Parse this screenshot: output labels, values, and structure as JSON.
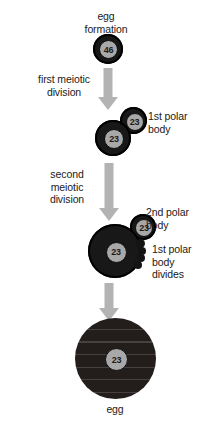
{
  "diagram": {
    "colors": {
      "cell_fill": "#181818",
      "nucleus_fill": "#a8a8a8",
      "arrow_fill": "#b3b3b3",
      "text": "#1a1a1a",
      "background": "#ffffff",
      "egg_fill": "#231d1c"
    }
  },
  "labels": {
    "egg_formation": "egg\nformation",
    "first_meiotic_division": "first meiotic\ndivision",
    "first_polar_body": "1st polar\nbody",
    "second_meiotic_division": "second\nmeiotic\ndivision",
    "second_polar_body": "2nd polar\nbody",
    "first_polar_body_divides": "1st polar\nbody\ndivides",
    "egg": "egg"
  },
  "cells": {
    "oocyte_primary": {
      "chromosome_count": "46"
    },
    "oocyte_secondary": {
      "chromosome_count": "23"
    },
    "polar_body_1": {
      "chromosome_count": "23"
    },
    "ootid": {
      "chromosome_count": "23"
    },
    "polar_body_2": {
      "chromosome_count": "23"
    },
    "mature_egg": {
      "chromosome_count": "23"
    }
  }
}
